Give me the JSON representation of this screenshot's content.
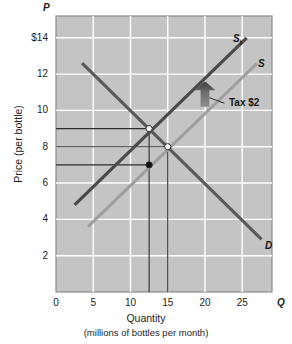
{
  "chart_data": {
    "type": "line",
    "title": "",
    "xlabel": "Quantity",
    "xlabel_sub": "(millions of bottles per month)",
    "ylabel": "Price (per bottle)",
    "x_axis_letter": "Q",
    "y_axis_letter": "P",
    "xlim": [
      0,
      29
    ],
    "ylim": [
      0,
      15.2
    ],
    "grid": true,
    "grid_color": "#ffffff",
    "plot_bg": "#c4c4c4",
    "x_ticks": [
      {
        "value": 0,
        "label": "0"
      },
      {
        "value": 5,
        "label": "5"
      },
      {
        "value": 10,
        "label": "10"
      },
      {
        "value": 15,
        "label": "15"
      },
      {
        "value": 20,
        "label": "20"
      },
      {
        "value": 25,
        "label": "25"
      }
    ],
    "y_ticks": [
      {
        "value": 14,
        "label": "$14"
      },
      {
        "value": 12,
        "label": "12"
      },
      {
        "value": 10,
        "label": "10"
      },
      {
        "value": 8,
        "label": "8"
      },
      {
        "value": 6,
        "label": "6"
      },
      {
        "value": 4,
        "label": "4"
      },
      {
        "value": 2,
        "label": "2"
      }
    ],
    "series": [
      {
        "name": "S_t",
        "label": "S",
        "label_sub": "t",
        "role": "supply-with-tax",
        "color": "#4a4a4a",
        "width": 3.2,
        "points": [
          [
            2.5,
            4.8
          ],
          [
            25.6,
            14.0
          ]
        ]
      },
      {
        "name": "S",
        "label": "S",
        "role": "supply",
        "color": "#9e9e9e",
        "width": 3.0,
        "points": [
          [
            4.3,
            3.6
          ],
          [
            27.0,
            12.6
          ]
        ]
      },
      {
        "name": "D",
        "label": "D",
        "role": "demand",
        "color": "#5a5a5a",
        "width": 3.2,
        "points": [
          [
            3.5,
            12.6
          ],
          [
            27.6,
            2.9
          ]
        ]
      }
    ],
    "points": [
      {
        "name": "equilibrium-with-tax",
        "x": 12.5,
        "y": 9.0,
        "style": "open"
      },
      {
        "name": "equilibrium-original",
        "x": 15.0,
        "y": 8.0,
        "style": "open"
      },
      {
        "name": "price-received-by-seller",
        "x": 12.5,
        "y": 7.0,
        "style": "filled"
      }
    ],
    "guide_lines": [
      {
        "name": "price-9-guide",
        "orientation": "horizontal",
        "y": 9.0,
        "x_from": 0,
        "x_to": 12.5
      },
      {
        "name": "price-8-guide",
        "orientation": "horizontal",
        "y": 8.0,
        "x_from": 0,
        "x_to": 15.0
      },
      {
        "name": "price-7-guide",
        "orientation": "horizontal",
        "y": 7.0,
        "x_from": 0,
        "x_to": 12.5
      },
      {
        "name": "quantity-12_5-guide",
        "orientation": "vertical",
        "x": 12.5,
        "y_from": 0,
        "y_to": 9.0
      },
      {
        "name": "quantity-15-guide",
        "orientation": "vertical",
        "x": 15.0,
        "y_from": 0,
        "y_to": 8.0
      }
    ],
    "annotations": [
      {
        "name": "tax-annotation",
        "text": "Tax $2",
        "arrow": "up",
        "arrow_x": 20.0,
        "arrow_y_from": 10.2,
        "arrow_y_to": 11.6,
        "leader_from": [
          22.6,
          10.4
        ],
        "leader_to": [
          20.6,
          10.7
        ]
      }
    ]
  }
}
